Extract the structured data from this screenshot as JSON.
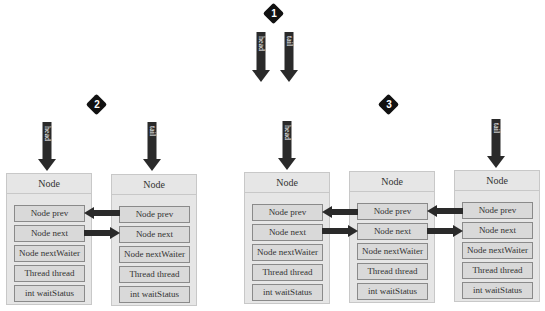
{
  "badges": [
    {
      "label": "1"
    },
    {
      "label": "2"
    },
    {
      "label": "3"
    }
  ],
  "pointers": {
    "head": "head",
    "tail": "tail"
  },
  "node": {
    "title": "Node",
    "fields": [
      "Node prev",
      "Node next",
      "Node nextWaiter",
      "Thread thread",
      "int waitStatus"
    ]
  },
  "scenes": [
    {
      "id": "1",
      "description": "empty queue: head and tail pointing to nothing",
      "node_count": 0
    },
    {
      "id": "2",
      "description": "two nodes linked via prev/next; head on first, tail on last",
      "node_count": 2
    },
    {
      "id": "3",
      "description": "three nodes linked via prev/next; head on first, tail on last",
      "node_count": 3
    }
  ],
  "colors": {
    "arrow": "#2a2a2a",
    "badge": "#111111",
    "node_bg": "#e6e6e6",
    "field_bg": "#d9d9d9",
    "field_border": "#8a8a8a"
  }
}
